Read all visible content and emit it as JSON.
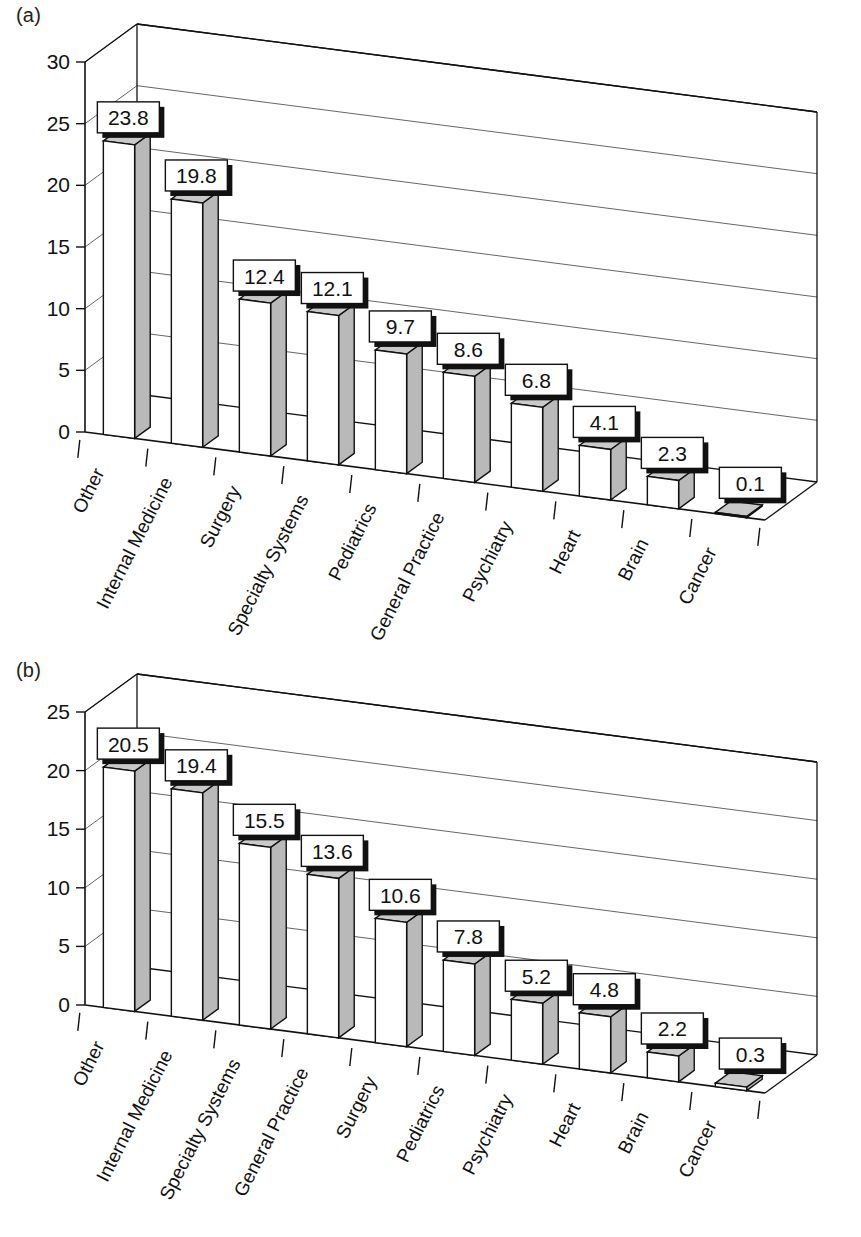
{
  "figure": {
    "panels": [
      {
        "tag": "(a)"
      },
      {
        "tag": "(b)"
      }
    ]
  },
  "chart_data": [
    {
      "type": "bar",
      "panel": "(a)",
      "title": "",
      "xlabel": "",
      "ylabel": "",
      "ylim": [
        0,
        30
      ],
      "yticks": [
        0,
        5,
        10,
        15,
        20,
        25,
        30
      ],
      "ytick_labels": [
        "0",
        "5",
        "10",
        "15",
        "20",
        "25",
        "30"
      ],
      "grid": true,
      "legend": "none",
      "projection": "3d",
      "categories": [
        "Other",
        "Internal Medicine",
        "Surgery",
        "Specialty Systems",
        "Pediatrics",
        "General Practice",
        "Psychiatry",
        "Heart",
        "Brain",
        "Cancer"
      ],
      "values": [
        23.8,
        19.8,
        12.4,
        12.1,
        9.7,
        8.6,
        6.8,
        4.1,
        2.3,
        0.1
      ],
      "data_labels": [
        "23.8",
        "19.8",
        "12.4",
        "12.1",
        "9.7",
        "8.6",
        "6.8",
        "4.1",
        "2.3",
        "0.1"
      ]
    },
    {
      "type": "bar",
      "panel": "(b)",
      "title": "",
      "xlabel": "",
      "ylabel": "",
      "ylim": [
        0,
        25
      ],
      "yticks": [
        0,
        5,
        10,
        15,
        20,
        25
      ],
      "ytick_labels": [
        "0",
        "5",
        "10",
        "15",
        "20",
        "25"
      ],
      "grid": true,
      "legend": "none",
      "projection": "3d",
      "categories": [
        "Other",
        "Internal Medicine",
        "Specialty Systems",
        "General Practice",
        "Surgery",
        "Pediatrics",
        "Psychiatry",
        "Heart",
        "Brain",
        "Cancer"
      ],
      "values": [
        20.5,
        19.4,
        15.5,
        13.6,
        10.6,
        7.8,
        5.2,
        4.8,
        2.2,
        0.3
      ],
      "data_labels": [
        "20.5",
        "19.4",
        "15.5",
        "13.6",
        "10.6",
        "7.8",
        "5.2",
        "4.8",
        "2.2",
        "0.3"
      ]
    }
  ],
  "colors": {
    "bar_front": "#ffffff",
    "bar_side": "#b9b9b9",
    "bar_top": "#c9c9c9",
    "outline": "#111111",
    "background": "#ffffff"
  }
}
